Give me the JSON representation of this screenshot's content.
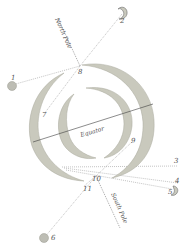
{
  "colors": {
    "ring_fill": "#c9c9bd",
    "ring_stroke": "#a8a89c",
    "body_fill": "#bdbdb4",
    "label": "#555555",
    "ray": "#9a9a9a"
  },
  "labels": {
    "north_pole": "North Pole",
    "south_pole": "South Pole",
    "equator": "Equator"
  },
  "points": [
    {
      "id": "1",
      "label": "1",
      "shape": "circle"
    },
    {
      "id": "2",
      "label": "2",
      "shape": "crescent"
    },
    {
      "id": "3",
      "label": "3",
      "shape": "none"
    },
    {
      "id": "4",
      "label": "4",
      "shape": "none"
    },
    {
      "id": "5",
      "label": "5",
      "shape": "crescent"
    },
    {
      "id": "6",
      "label": "6",
      "shape": "circle"
    },
    {
      "id": "7",
      "label": "7",
      "shape": "none"
    },
    {
      "id": "8",
      "label": "8",
      "shape": "none"
    },
    {
      "id": "9",
      "label": "9",
      "shape": "none"
    },
    {
      "id": "10",
      "label": "10",
      "shape": "none"
    },
    {
      "id": "11",
      "label": "11",
      "shape": "none"
    }
  ]
}
